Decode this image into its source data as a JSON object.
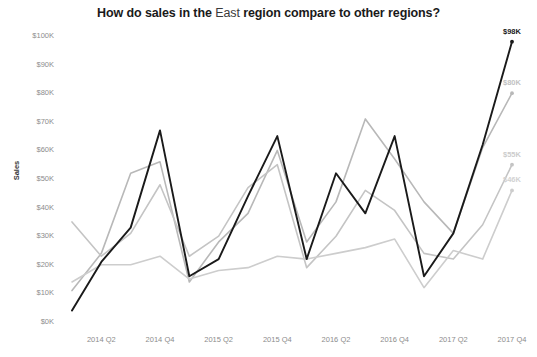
{
  "chart_data": {
    "type": "line",
    "title": "How do sales in the East region compare to other regions?",
    "title_parts": {
      "before": "How do sales in the ",
      "highlight": "East",
      "after": " region compare to other regions?"
    },
    "xlabel": "",
    "ylabel": "Sales",
    "ylim": [
      0,
      100000
    ],
    "ytick_labels": [
      "$100K",
      "$90K",
      "$80K",
      "$70K",
      "$60K",
      "$50K",
      "$40K",
      "$30K",
      "$20K",
      "$10K",
      "$0K"
    ],
    "ytick_values": [
      100000,
      90000,
      80000,
      70000,
      60000,
      50000,
      40000,
      30000,
      20000,
      10000,
      0
    ],
    "xtick_labels": [
      "2014 Q2",
      "2014 Q4",
      "2015 Q2",
      "2015 Q4",
      "2016 Q2",
      "2016 Q4",
      "2017 Q2",
      "2017 Q4"
    ],
    "x": [
      "2014 Q1",
      "2014 Q2",
      "2014 Q3",
      "2014 Q4",
      "2015 Q1",
      "2015 Q2",
      "2015 Q3",
      "2015 Q4",
      "2016 Q1",
      "2016 Q2",
      "2016 Q3",
      "2016 Q4",
      "2017 Q1",
      "2017 Q2",
      "2017 Q3",
      "2017 Q4"
    ],
    "grid": false,
    "legend": "none",
    "series": [
      {
        "name": "East",
        "color": "#1a1a1a",
        "width": 1.9,
        "end_label": "$98K",
        "end_label_color": "#1a1a1a",
        "values": [
          4000,
          21000,
          33000,
          67000,
          16000,
          22000,
          44000,
          65000,
          22000,
          52000,
          38000,
          65000,
          16000,
          31000,
          62000,
          98000
        ]
      },
      {
        "name": "Region B",
        "color": "#b8b8b8",
        "width": 1.6,
        "end_label": "$80K",
        "end_label_color": "#c2c2c2",
        "values": [
          11000,
          24000,
          52000,
          56000,
          14000,
          28000,
          38000,
          60000,
          28000,
          42000,
          71000,
          57000,
          42000,
          31000,
          61000,
          80000
        ]
      },
      {
        "name": "Region C",
        "color": "#c4c4c4",
        "width": 1.6,
        "end_label": "$55K",
        "end_label_color": "#cccccc",
        "values": [
          35000,
          23000,
          31000,
          48000,
          23000,
          30000,
          47000,
          55000,
          19000,
          30000,
          46000,
          39000,
          24000,
          22000,
          34000,
          55000
        ]
      },
      {
        "name": "Region D",
        "color": "#cdcdcd",
        "width": 1.6,
        "end_label": "$46K",
        "end_label_color": "#d2d2d2",
        "values": [
          14000,
          20000,
          20000,
          23000,
          15000,
          18000,
          19000,
          23000,
          22000,
          24000,
          26000,
          29000,
          12000,
          25000,
          22000,
          46000
        ]
      }
    ]
  }
}
